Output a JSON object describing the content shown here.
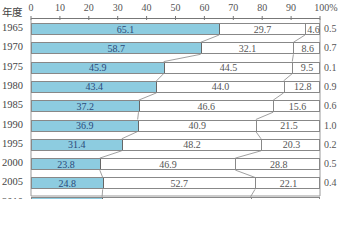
{
  "chart_data": {
    "type": "bar",
    "stacked": true,
    "orientation": "horizontal",
    "percent": true,
    "title": "",
    "ylabel": "年度",
    "xlabel": "",
    "xlim": [
      0,
      100
    ],
    "x_ticks": [
      "0",
      "10",
      "20",
      "30",
      "40",
      "50",
      "60",
      "70",
      "80",
      "90",
      "100%"
    ],
    "categories": [
      "1965",
      "1970",
      "1975",
      "1980",
      "1985",
      "1990",
      "1995",
      "2000",
      "2005",
      "2010"
    ],
    "series": [
      {
        "name": "segment-1",
        "color": "#8dcce0",
        "values": [
          65.1,
          58.7,
          45.9,
          43.4,
          37.2,
          36.9,
          31.4,
          23.8,
          24.8,
          24.6
        ]
      },
      {
        "name": "segment-2",
        "color": "#ffffff",
        "values": [
          29.7,
          32.1,
          44.5,
          44.0,
          46.6,
          40.9,
          48.2,
          46.9,
          52.7,
          51.4
        ]
      },
      {
        "name": "segment-3",
        "color": "#ffffff",
        "values": [
          4.6,
          8.6,
          9.5,
          12.8,
          15.6,
          21.5,
          20.3,
          28.8,
          22.1,
          23.8
        ]
      },
      {
        "name": "segment-4",
        "color": "#ffffff",
        "values": [
          0.5,
          0.7,
          0.1,
          0.9,
          0.6,
          1.0,
          0.2,
          0.5,
          0.4,
          0.2
        ]
      }
    ],
    "labels": {
      "seg1": [
        "65.1",
        "58.7",
        "45.9",
        "43.4",
        "37.2",
        "36.9",
        "31.4",
        "23.8",
        "24.8",
        "24.6"
      ],
      "seg2": [
        "29.7",
        "32.1",
        "44.5",
        "44.0",
        "46.6",
        "40.9",
        "48.2",
        "46.9",
        "52.7",
        "51.4"
      ],
      "seg3": [
        "4.6",
        "8.6",
        "9.5",
        "12.8",
        "15.6",
        "21.5",
        "20.3",
        "28.8",
        "22.1",
        "23.8"
      ],
      "seg4": [
        "0.5",
        "0.7",
        "0.1",
        "0.9",
        "0.6",
        "1.0",
        "0.2",
        "0.5",
        "0.4",
        "0.2"
      ]
    },
    "grid": false,
    "legend": "none"
  }
}
